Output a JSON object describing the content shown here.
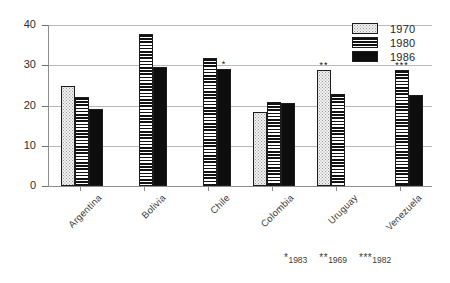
{
  "chart_data": {
    "type": "bar",
    "title": "",
    "xlabel": "",
    "ylabel": "",
    "ylim": [
      0,
      40
    ],
    "yticks": [
      0,
      10,
      20,
      30,
      40
    ],
    "grid": true,
    "legend_position": "top-right",
    "categories": [
      "Argentina",
      "Bolivia",
      "Chile",
      "Colombia",
      "Uruguay",
      "Venezuela"
    ],
    "series": [
      {
        "name": "1970",
        "values": [
          24.8,
          null,
          null,
          18.5,
          28.8,
          null
        ]
      },
      {
        "name": "1980",
        "values": [
          22.2,
          37.7,
          31.7,
          20.8,
          22.8,
          28.8
        ]
      },
      {
        "name": "1986",
        "values": [
          19.2,
          29.5,
          29.0,
          20.6,
          null,
          22.7
        ]
      }
    ],
    "annotations": [
      {
        "category": "Chile",
        "series": "1986",
        "mark": "*"
      },
      {
        "category": "Uruguay",
        "series": "1970",
        "mark": "**"
      },
      {
        "category": "Venezuela",
        "series": "1980",
        "mark": "***"
      }
    ]
  },
  "legend": {
    "items": [
      {
        "label": "1970",
        "pattern": "dotted"
      },
      {
        "label": "1980",
        "pattern": "horizontal-stripes"
      },
      {
        "label": "1986",
        "pattern": "solid-black"
      }
    ]
  },
  "axis": {
    "y_tick_labels": [
      "40",
      "30",
      "20",
      "10",
      "0"
    ]
  },
  "x_labels": [
    "Argentina",
    "Bolivia",
    "Chile",
    "Colombia",
    "Uruguay",
    "Venezuela"
  ],
  "footnotes": [
    {
      "mark": "*",
      "year": "1983"
    },
    {
      "mark": "**",
      "year": "1969"
    },
    {
      "mark": "***",
      "year": "1982"
    }
  ],
  "colors": {
    "axis": "#8d8d8d",
    "grid": "#b9b9b9",
    "bar_1986": "#0d0d0d",
    "bar_1970": "#f2f2f2",
    "text": "#2e2e2e",
    "background": "#ffffff"
  }
}
